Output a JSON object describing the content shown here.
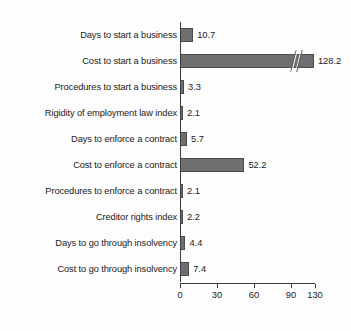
{
  "chart_data": {
    "type": "bar",
    "orientation": "horizontal",
    "title": "",
    "subtitle": "",
    "xlabel": "",
    "ylabel": "",
    "grid": false,
    "legend": null,
    "axis_break": {
      "present": true,
      "applies_to": "Cost to start a business",
      "note": "x axis compressed between 90 and 130"
    },
    "xlim": [
      0,
      130
    ],
    "xticks": [
      0,
      30,
      60,
      90,
      130
    ],
    "xtick_labels": [
      "0",
      "30",
      "60",
      "90",
      "130"
    ],
    "categories": [
      "Days to start a business",
      "Cost to start a business",
      "Procedures to start a business",
      "Rigidity of employment law index",
      "Days to enforce a contract",
      "Cost to enforce a contract",
      "Procedures to enforce a contract",
      "Creditor rights index",
      "Days to go through insolvency",
      "Cost to go through insolvency"
    ],
    "values": [
      10.7,
      128.2,
      3.3,
      2.1,
      5.7,
      52.2,
      2.1,
      2.2,
      4.4,
      7.4
    ],
    "value_labels": [
      "10.7",
      "128.2",
      "3.3",
      "2.1",
      "5.7",
      "52.2",
      "2.1",
      "2.2",
      "4.4",
      "7.4"
    ],
    "colors": {
      "bar_fill": "#6f6f6f",
      "bar_stroke": "#4a4a4a",
      "axis": "#3d3d3d",
      "text": "#1b1b1b",
      "background": "#fdfdfd"
    }
  }
}
